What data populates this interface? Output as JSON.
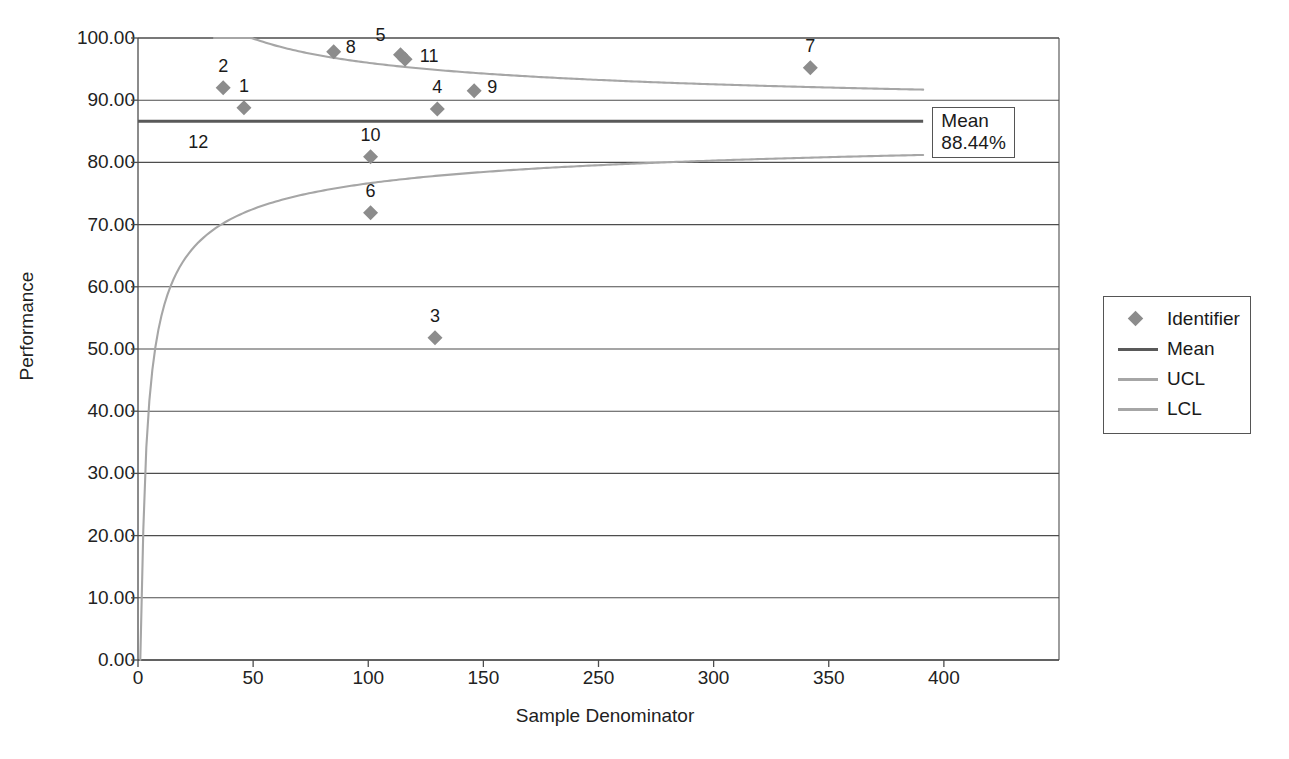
{
  "chart_data": {
    "type": "scatter",
    "title": "",
    "xlabel": "Sample Denominator",
    "ylabel": "Performance",
    "xlim": [
      0,
      400
    ],
    "ylim": [
      0,
      100
    ],
    "xticks": [
      0,
      50,
      100,
      150,
      250,
      300,
      350,
      400
    ],
    "xtick_labels": [
      "0",
      "50",
      "100",
      "150",
      "250",
      "300",
      "350",
      "400"
    ],
    "xtick_positions": [
      0,
      50,
      100,
      150,
      200,
      250,
      300,
      350
    ],
    "yticks": [
      0,
      10,
      20,
      30,
      40,
      50,
      60,
      70,
      80,
      90,
      100
    ],
    "ytick_labels": [
      "0.00",
      "10.00",
      "20.00",
      "30.00",
      "40.00",
      "50.00",
      "60.00",
      "70.00",
      "80.00",
      "90.00",
      "100.00"
    ],
    "grid": "horizontal",
    "legend_position": "right",
    "mean_value": 88.44,
    "mean_annotation": [
      "Mean",
      "88.44%"
    ],
    "series": [
      {
        "name": "Identifier",
        "marker": "diamond",
        "color": "#8c8c8c",
        "points": [
          {
            "label": "1",
            "x": 46,
            "y": 88.8
          },
          {
            "label": "2",
            "x": 37,
            "y": 92.0
          },
          {
            "label": "3",
            "x": 129,
            "y": 51.8
          },
          {
            "label": "4",
            "x": 130,
            "y": 88.6
          },
          {
            "label": "5",
            "x": 114,
            "y": 97.3
          },
          {
            "label": "6",
            "x": 101,
            "y": 71.9
          },
          {
            "label": "7",
            "x": 292,
            "y": 95.2
          },
          {
            "label": "8",
            "x": 85,
            "y": 97.8
          },
          {
            "label": "9",
            "x": 146,
            "y": 91.5
          },
          {
            "label": "10",
            "x": 101,
            "y": 80.9
          },
          {
            "label": "11",
            "x": 116,
            "y": 96.6
          },
          {
            "label": "12",
            "x": 14,
            "y": 85.0,
            "marker_hidden": true
          }
        ]
      },
      {
        "name": "Mean",
        "type": "line",
        "color": "#595959",
        "value": 86.6,
        "x_start": 0,
        "x_end": 341
      },
      {
        "name": "UCL",
        "type": "curve",
        "color": "#a6a6a6",
        "x_start": 33,
        "x_end": 341,
        "y_start": 100.0,
        "y_end": 91.7
      },
      {
        "name": "LCL",
        "type": "curve",
        "color": "#a6a6a6",
        "x_start": 1,
        "x_end": 341,
        "y_start": 0.0,
        "y_end": 81.2
      }
    ],
    "legend_entries": [
      {
        "label": "Identifier",
        "key": "diamond",
        "color": "#8c8c8c"
      },
      {
        "label": "Mean",
        "key": "line",
        "color": "#595959"
      },
      {
        "label": "UCL",
        "key": "line",
        "color": "#a6a6a6"
      },
      {
        "label": "LCL",
        "key": "line",
        "color": "#a6a6a6"
      }
    ]
  }
}
